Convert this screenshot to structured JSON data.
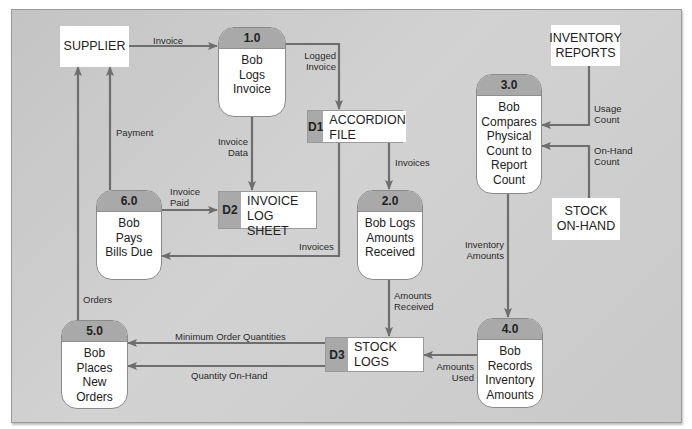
{
  "diagram": {
    "type": "data-flow-diagram",
    "colors": {
      "background_panel": "#c9c9c9",
      "header_fill": "#a9a9a9",
      "flow_line": "#6e6e6e",
      "box_fill": "#ffffff"
    },
    "entities": {
      "supplier": "SUPPLIER",
      "inventory_reports": "INVENTORY\nREPORTS",
      "stock_on_hand": "STOCK\nON-HAND"
    },
    "processes": {
      "p1": {
        "id": "1.0",
        "name": "Bob\nLogs\nInvoice"
      },
      "p2": {
        "id": "2.0",
        "name": "Bob Logs\nAmounts\nReceived"
      },
      "p3": {
        "id": "3.0",
        "name": "Bob\nCompares\nPhysical\nCount to\nReport\nCount"
      },
      "p4": {
        "id": "4.0",
        "name": "Bob\nRecords\nInventory\nAmounts"
      },
      "p5": {
        "id": "5.0",
        "name": "Bob\nPlaces\nNew\nOrders"
      },
      "p6": {
        "id": "6.0",
        "name": "Bob\nPays\nBills Due"
      }
    },
    "stores": {
      "d1": {
        "id": "D1",
        "name": "ACCORDION\nFILE"
      },
      "d2": {
        "id": "D2",
        "name": "INVOICE\nLOG SHEET"
      },
      "d3": {
        "id": "D3",
        "name": "STOCK\nLOGS"
      }
    },
    "flows": {
      "invoice": "Invoice",
      "logged_invoice": "Logged\nInvoice",
      "invoice_data": "Invoice\nData",
      "invoices_to_p2": "Invoices",
      "invoices_to_p6": "Invoices",
      "invoice_paid": "Invoice\nPaid",
      "payment": "Payment",
      "orders": "Orders",
      "usage_count": "Usage\nCount",
      "on_hand_count": "On-Hand\nCount",
      "inventory_amounts": "Inventory\nAmounts",
      "amounts_received": "Amounts\nReceived",
      "amounts_used": "Amounts\nUsed",
      "min_order_qty": "Minimum Order Quantities",
      "quantity_on_hand": "Quantity On-Hand"
    }
  }
}
